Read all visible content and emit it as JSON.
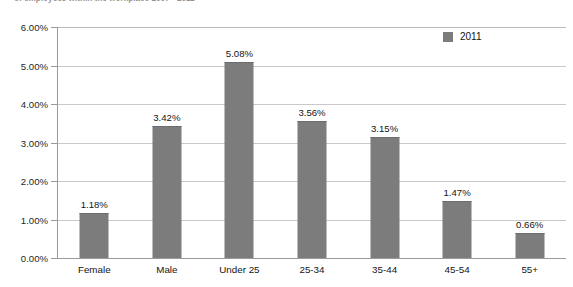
{
  "figure": {
    "caption_top": "of employees within the workplace 2007 - 2011",
    "caption_bottom": ""
  },
  "chart_data": {
    "type": "bar",
    "title": "",
    "xlabel": "",
    "ylabel": "",
    "ylim": [
      0,
      6
    ],
    "ytick_labels": [
      "6.00%",
      "5.00%",
      "4.00%",
      "3.00%",
      "2.00%",
      "1.00%",
      "0.00%"
    ],
    "ytick_values": [
      6,
      5,
      4,
      3,
      2,
      1,
      0
    ],
    "grid": true,
    "legend_position": "top-right",
    "legend": [
      "2011"
    ],
    "bar_color": "#7c7c7c",
    "categories": [
      "Female",
      "Male",
      "Under 25",
      "25-34",
      "35-44",
      "45-54",
      "55+"
    ],
    "values": [
      1.18,
      3.42,
      5.08,
      3.56,
      3.15,
      1.47,
      0.66
    ],
    "value_labels": [
      "1.18%",
      "3.42%",
      "5.08%",
      "3.56%",
      "3.15%",
      "1.47%",
      "0.66%"
    ],
    "series": [
      {
        "name": "2011",
        "values": [
          1.18,
          3.42,
          5.08,
          3.56,
          3.15,
          1.47,
          0.66
        ]
      }
    ]
  }
}
